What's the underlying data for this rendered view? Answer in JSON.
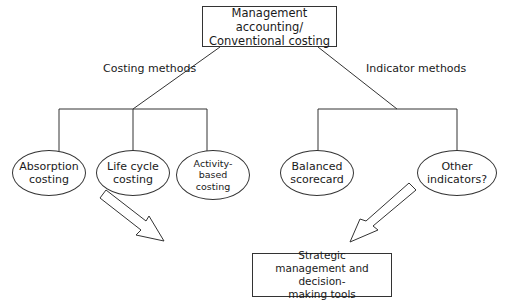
{
  "root": {
    "label": "Management accounting/\nConventional costing"
  },
  "branches": {
    "left": {
      "label": "Costing methods"
    },
    "right": {
      "label": "Indicator methods"
    }
  },
  "leaves": [
    {
      "label": "Absorption\ncosting"
    },
    {
      "label": "Life cycle\ncosting"
    },
    {
      "label": "Activity-\nbased\ncosting"
    },
    {
      "label": "Balanced\nscorecard"
    },
    {
      "label": "Other\nindicators?"
    }
  ],
  "target": {
    "label": "Strategic\nmanagement and decision-\nmaking tools"
  },
  "arrows": [
    {
      "from": "costing-methods",
      "to": "strategic-tools"
    },
    {
      "from": "indicator-methods",
      "to": "strategic-tools"
    }
  ]
}
